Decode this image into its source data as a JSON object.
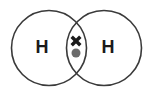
{
  "diagram": {
    "molecule": "H2",
    "background_color": "#ffffff",
    "stroke_color": "#3a3a3a",
    "label_color": "#1a1a1a",
    "cross_color": "#1a1a1a",
    "dot_color": "#6b6b6b",
    "atoms": [
      {
        "id": "left",
        "label": "H",
        "label_x": 42,
        "label_y": 47,
        "circle_cx": 49,
        "circle_cy": 48,
        "circle_r": 37.5
      },
      {
        "id": "right",
        "label": "H",
        "label_x": 108,
        "label_y": 47,
        "circle_cx": 104,
        "circle_cy": 48,
        "circle_r": 37.5
      }
    ],
    "shared_electrons": [
      {
        "id": "cross-electron",
        "symbol": "cross",
        "symbol_text": "×",
        "cx": 76,
        "cy": 41,
        "size": 11,
        "color": "#1a1a1a"
      },
      {
        "id": "dot-electron",
        "symbol": "dot",
        "symbol_text": "•",
        "cx": 76,
        "cy": 53,
        "size": 4.5,
        "color": "#6b6b6b"
      }
    ],
    "stroke_width": 1.6
  }
}
